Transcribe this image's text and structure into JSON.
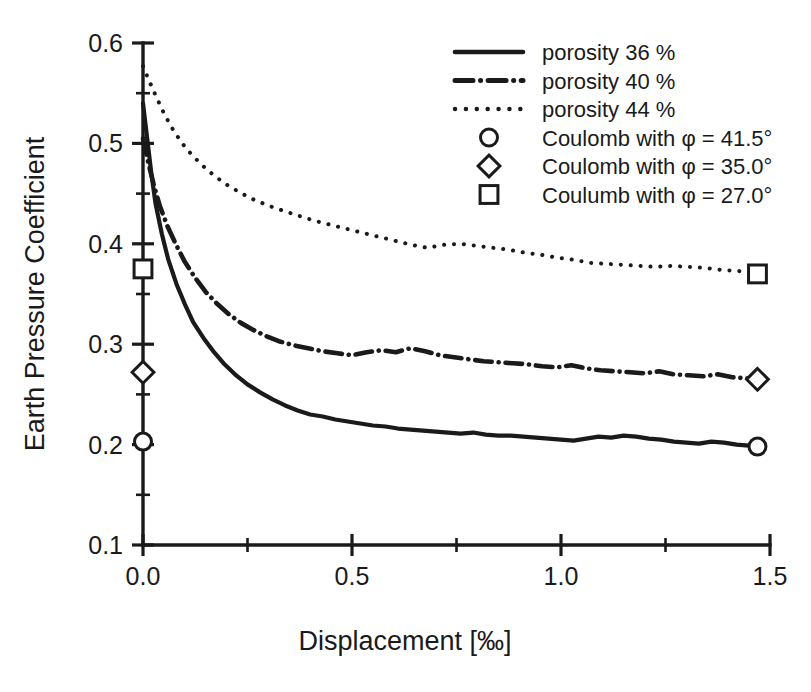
{
  "chart_data": {
    "type": "line",
    "title": "",
    "xlabel": "Displacement [‰]",
    "ylabel": "Earth Pressure Coefficient",
    "xlim": [
      0.0,
      1.5
    ],
    "ylim": [
      0.1,
      0.6
    ],
    "grid": false,
    "legend_position": "top-right",
    "x_ticks_major": [
      "0.0",
      "0.5",
      "1.0",
      "1.5"
    ],
    "x_ticks_major_values": [
      0.0,
      0.5,
      1.0,
      1.5
    ],
    "x_ticks_minor_values": [
      0.25,
      0.75,
      1.25
    ],
    "y_ticks_major": [
      "0.1",
      "0.2",
      "0.3",
      "0.4",
      "0.5",
      "0.6"
    ],
    "y_ticks_major_values": [
      0.1,
      0.2,
      0.3,
      0.4,
      0.5,
      0.6
    ],
    "y_ticks_minor_values": [
      0.15,
      0.25,
      0.35,
      0.45,
      0.55
    ],
    "series": [
      {
        "name": "porosity 36 %",
        "style": "solid",
        "x": [
          0.0,
          0.01,
          0.02,
          0.03,
          0.045,
          0.06,
          0.08,
          0.1,
          0.12,
          0.145,
          0.17,
          0.195,
          0.22,
          0.25,
          0.28,
          0.31,
          0.34,
          0.37,
          0.4,
          0.43,
          0.46,
          0.49,
          0.52,
          0.55,
          0.58,
          0.61,
          0.64,
          0.67,
          0.7,
          0.73,
          0.76,
          0.79,
          0.82,
          0.85,
          0.88,
          0.91,
          0.94,
          0.97,
          1.0,
          1.03,
          1.06,
          1.09,
          1.12,
          1.15,
          1.18,
          1.21,
          1.24,
          1.27,
          1.3,
          1.33,
          1.36,
          1.39,
          1.42,
          1.45,
          1.47
        ],
        "y": [
          0.54,
          0.505,
          0.47,
          0.44,
          0.41,
          0.385,
          0.36,
          0.34,
          0.322,
          0.306,
          0.292,
          0.28,
          0.27,
          0.26,
          0.252,
          0.245,
          0.239,
          0.234,
          0.23,
          0.228,
          0.225,
          0.223,
          0.221,
          0.219,
          0.218,
          0.216,
          0.215,
          0.214,
          0.213,
          0.212,
          0.211,
          0.212,
          0.21,
          0.209,
          0.209,
          0.208,
          0.207,
          0.206,
          0.205,
          0.204,
          0.206,
          0.208,
          0.207,
          0.209,
          0.208,
          0.206,
          0.205,
          0.203,
          0.202,
          0.201,
          0.203,
          0.202,
          0.2,
          0.199,
          0.198
        ]
      },
      {
        "name": "porosity 40 %",
        "style": "dashdot",
        "x": [
          0.0,
          0.012,
          0.025,
          0.04,
          0.058,
          0.078,
          0.1,
          0.125,
          0.15,
          0.178,
          0.205,
          0.235,
          0.265,
          0.295,
          0.325,
          0.36,
          0.395,
          0.43,
          0.465,
          0.5,
          0.535,
          0.57,
          0.605,
          0.64,
          0.675,
          0.71,
          0.745,
          0.78,
          0.815,
          0.85,
          0.885,
          0.92,
          0.955,
          0.99,
          1.025,
          1.06,
          1.095,
          1.13,
          1.165,
          1.2,
          1.235,
          1.27,
          1.305,
          1.34,
          1.375,
          1.41,
          1.445,
          1.47
        ],
        "y": [
          0.505,
          0.482,
          0.46,
          0.438,
          0.418,
          0.4,
          0.382,
          0.366,
          0.352,
          0.34,
          0.33,
          0.321,
          0.314,
          0.308,
          0.303,
          0.299,
          0.296,
          0.293,
          0.291,
          0.289,
          0.292,
          0.294,
          0.292,
          0.296,
          0.293,
          0.289,
          0.287,
          0.285,
          0.283,
          0.282,
          0.281,
          0.28,
          0.278,
          0.277,
          0.279,
          0.276,
          0.274,
          0.273,
          0.272,
          0.271,
          0.273,
          0.27,
          0.269,
          0.268,
          0.27,
          0.267,
          0.266,
          0.265
        ]
      },
      {
        "name": "porosity 44 %",
        "style": "dotted",
        "x": [
          0.0,
          0.015,
          0.032,
          0.05,
          0.07,
          0.092,
          0.116,
          0.142,
          0.17,
          0.2,
          0.232,
          0.265,
          0.3,
          0.335,
          0.372,
          0.41,
          0.448,
          0.486,
          0.525,
          0.564,
          0.603,
          0.642,
          0.681,
          0.72,
          0.759,
          0.798,
          0.837,
          0.876,
          0.915,
          0.954,
          0.993,
          1.032,
          1.071,
          1.11,
          1.149,
          1.188,
          1.227,
          1.266,
          1.305,
          1.344,
          1.383,
          1.422,
          1.461,
          1.47
        ],
        "y": [
          0.577,
          0.562,
          0.546,
          0.53,
          0.515,
          0.501,
          0.489,
          0.478,
          0.468,
          0.459,
          0.451,
          0.444,
          0.438,
          0.433,
          0.428,
          0.423,
          0.419,
          0.415,
          0.411,
          0.407,
          0.403,
          0.399,
          0.396,
          0.399,
          0.4,
          0.398,
          0.396,
          0.394,
          0.391,
          0.389,
          0.386,
          0.384,
          0.381,
          0.38,
          0.379,
          0.378,
          0.377,
          0.378,
          0.377,
          0.376,
          0.374,
          0.373,
          0.371,
          0.37
        ]
      }
    ],
    "markers": [
      {
        "name": "Coulomb with φ = 41.5°",
        "shape": "circle",
        "points": [
          {
            "x": 0.0,
            "y": 0.203
          },
          {
            "x": 1.47,
            "y": 0.198
          }
        ]
      },
      {
        "name": "Coulomb with φ = 35.0°",
        "shape": "diamond",
        "points": [
          {
            "x": 0.0,
            "y": 0.272
          },
          {
            "x": 1.47,
            "y": 0.265
          }
        ]
      },
      {
        "name": "Coulumb with φ = 27.0°",
        "shape": "square",
        "points": [
          {
            "x": 0.0,
            "y": 0.375
          },
          {
            "x": 1.47,
            "y": 0.37
          }
        ]
      }
    ],
    "legend_entries": [
      {
        "label": "porosity 36 %",
        "kind": "line",
        "style": "solid"
      },
      {
        "label": "porosity 40 %",
        "kind": "line",
        "style": "dashdot"
      },
      {
        "label": "porosity 44 %",
        "kind": "line",
        "style": "dotted"
      },
      {
        "label": "Coulomb with φ = 41.5°",
        "kind": "marker",
        "style": "circle"
      },
      {
        "label": "Coulomb with φ = 35.0°",
        "kind": "marker",
        "style": "diamond"
      },
      {
        "label": "Coulumb with φ = 27.0°",
        "kind": "marker",
        "style": "square"
      }
    ],
    "colors": {
      "ink": "#1a1a1a",
      "background": "#ffffff"
    }
  }
}
